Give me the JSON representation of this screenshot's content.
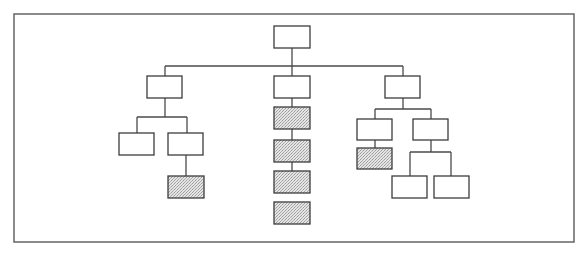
{
  "diagram": {
    "type": "org-chart / tree hierarchy",
    "colors": {
      "frame": "#5a5a5a",
      "box_border": "#3c3c3c",
      "plain_fill": "#ffffff",
      "shaded_fill": "#d0d0d0",
      "connector": "#4a4a4a"
    },
    "frame": {
      "x": 14,
      "y": 14,
      "w": 560,
      "h": 228
    },
    "nodes": [
      {
        "id": "root",
        "x": 274,
        "y": 26,
        "w": 36,
        "h": 22,
        "style": "plain"
      },
      {
        "id": "L",
        "x": 147,
        "y": 76,
        "w": 35,
        "h": 22,
        "style": "plain"
      },
      {
        "id": "C",
        "x": 274,
        "y": 76,
        "w": 36,
        "h": 22,
        "style": "plain"
      },
      {
        "id": "R",
        "x": 385,
        "y": 76,
        "w": 35,
        "h": 22,
        "style": "plain"
      },
      {
        "id": "L1",
        "x": 119,
        "y": 133,
        "w": 35,
        "h": 22,
        "style": "plain"
      },
      {
        "id": "L2",
        "x": 168,
        "y": 133,
        "w": 35,
        "h": 22,
        "style": "plain"
      },
      {
        "id": "L2a",
        "x": 168,
        "y": 176,
        "w": 36,
        "h": 22,
        "style": "shaded"
      },
      {
        "id": "C1",
        "x": 274,
        "y": 107,
        "w": 36,
        "h": 22,
        "style": "shaded"
      },
      {
        "id": "C2",
        "x": 274,
        "y": 140,
        "w": 36,
        "h": 22,
        "style": "shaded"
      },
      {
        "id": "C3",
        "x": 274,
        "y": 171,
        "w": 36,
        "h": 22,
        "style": "shaded"
      },
      {
        "id": "C4",
        "x": 274,
        "y": 202,
        "w": 36,
        "h": 22,
        "style": "shaded"
      },
      {
        "id": "R1",
        "x": 357,
        "y": 119,
        "w": 35,
        "h": 21,
        "style": "plain"
      },
      {
        "id": "R1a",
        "x": 357,
        "y": 148,
        "w": 35,
        "h": 21,
        "style": "shaded"
      },
      {
        "id": "R2",
        "x": 413,
        "y": 119,
        "w": 35,
        "h": 21,
        "style": "plain"
      },
      {
        "id": "R2a",
        "x": 392,
        "y": 176,
        "w": 35,
        "h": 22,
        "style": "plain"
      },
      {
        "id": "R2b",
        "x": 434,
        "y": 176,
        "w": 35,
        "h": 22,
        "style": "plain"
      }
    ],
    "edges": [
      {
        "d": "M292 48 V66"
      },
      {
        "d": "M165 66 H403"
      },
      {
        "d": "M165 66 V76"
      },
      {
        "d": "M292 66 V76"
      },
      {
        "d": "M403 66 V76"
      },
      {
        "d": "M165 98 V117"
      },
      {
        "d": "M137 117 H187"
      },
      {
        "d": "M137 117 V133"
      },
      {
        "d": "M187 117 V133"
      },
      {
        "d": "M186 155 V176"
      },
      {
        "d": "M292 98 V107"
      },
      {
        "d": "M292 129 V140"
      },
      {
        "d": "M292 162 V171"
      },
      {
        "d": "M403 98 V109"
      },
      {
        "d": "M375 109 H431"
      },
      {
        "d": "M375 109 V119"
      },
      {
        "d": "M431 109 V119"
      },
      {
        "d": "M375 140 V148"
      },
      {
        "d": "M431 140 V152"
      },
      {
        "d": "M410 152 H451"
      },
      {
        "d": "M410 152 V176"
      },
      {
        "d": "M451 152 V176"
      }
    ]
  }
}
